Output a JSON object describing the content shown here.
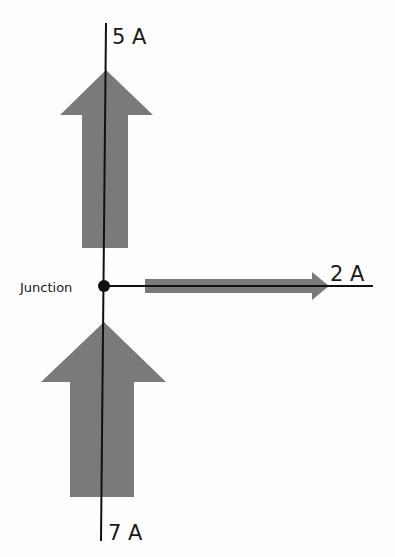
{
  "diagram": {
    "junction_label": "Junction",
    "currents": [
      {
        "label": "5 A",
        "direction": "out",
        "position": "top"
      },
      {
        "label": "2 A",
        "direction": "out",
        "position": "right"
      },
      {
        "label": "7 A",
        "direction": "in",
        "position": "bottom"
      }
    ],
    "colors": {
      "arrow": "#7a7a7a",
      "wire": "#111111",
      "background": "#fdfdfd"
    }
  }
}
